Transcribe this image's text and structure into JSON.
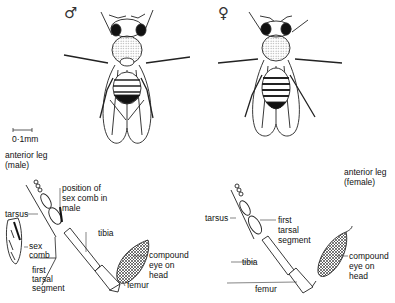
{
  "diagram": {
    "male": {
      "symbol": "♂",
      "scale_label": "0·1mm",
      "leg_title_line1": "anterior leg",
      "leg_title_line2": "(male)",
      "labels": {
        "sex_comb_pos_1": "position of",
        "sex_comb_pos_2": "sex comb in",
        "sex_comb_pos_3": "male",
        "tarsus": "tarsus",
        "tibia": "tibia",
        "sex_comb_1": "sex",
        "sex_comb_2": "comb",
        "first_tarsal_1": "first",
        "first_tarsal_2": "tarsal",
        "first_tarsal_3": "segment",
        "compound_eye_1": "compound",
        "compound_eye_2": "eye on",
        "compound_eye_3": "head",
        "femur": "femur"
      }
    },
    "female": {
      "symbol": "♀",
      "leg_title_line1": "anterior leg",
      "leg_title_line2": "(female)",
      "labels": {
        "tarsus": "tarsus",
        "first_tarsal_1": "first",
        "first_tarsal_2": "tarsal",
        "first_tarsal_3": "segment",
        "tibia": "tibia",
        "compound_eye_1": "compound",
        "compound_eye_2": "eye on",
        "compound_eye_3": "head",
        "femur": "femur"
      }
    }
  }
}
